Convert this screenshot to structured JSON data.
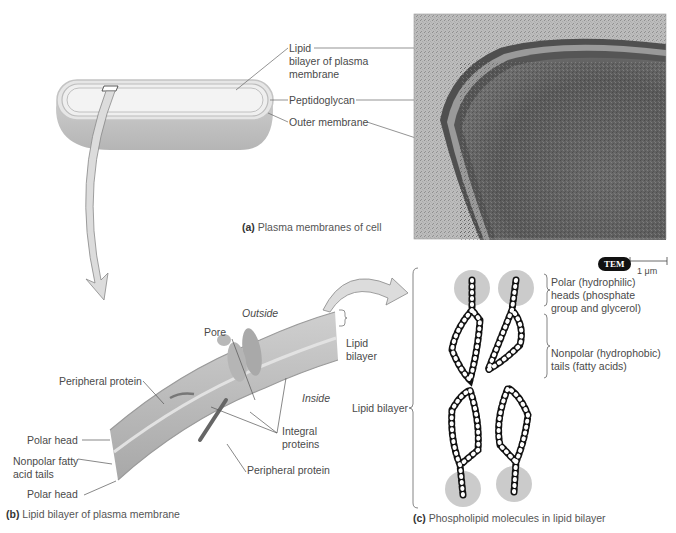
{
  "panel_a": {
    "caption_letter": "(a)",
    "caption_text": "Plasma membranes of cell",
    "labels": {
      "lipid_bilayer_l1": "Lipid",
      "lipid_bilayer_l2": "bilayer of plasma",
      "lipid_bilayer_l3": "membrane",
      "peptidoglycan": "Peptidoglycan",
      "outer_membrane": "Outer membrane"
    },
    "micrograph": {
      "badge": "TEM",
      "scale_bar": "1 μm"
    }
  },
  "panel_b": {
    "caption_letter": "(b)",
    "caption_text": "Lipid bilayer of plasma membrane",
    "labels": {
      "outside": "Outside",
      "inside": "Inside",
      "pore": "Pore",
      "lipid_bilayer_l1": "Lipid",
      "lipid_bilayer_l2": "bilayer",
      "peripheral_protein_top": "Peripheral protein",
      "peripheral_protein_bottom": "Peripheral protein",
      "integral_l1": "Integral",
      "integral_l2": "proteins",
      "polar_head_top": "Polar head",
      "nonpolar_l1": "Nonpolar fatty",
      "nonpolar_l2": "acid tails",
      "polar_head_bottom": "Polar head"
    }
  },
  "panel_c": {
    "caption_letter": "(c)",
    "caption_text": "Phospholipid molecules in lipid bilayer",
    "labels": {
      "lipid_bilayer": "Lipid bilayer",
      "polar_l1": "Polar (hydrophilic)",
      "polar_l2": "heads (phosphate",
      "polar_l3": "group and glycerol)",
      "nonpolar_l1": "Nonpolar (hydrophobic)",
      "nonpolar_l2": "tails (fatty acids)"
    }
  },
  "colors": {
    "cell_body": "#bdbdbd",
    "cell_top": "#e6e6e6",
    "micrograph_dark": "#5a5a5a",
    "arrow_fill": "#d0d0d0",
    "head_circle": "#c8c8c8"
  }
}
